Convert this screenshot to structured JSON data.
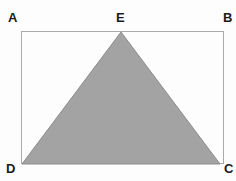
{
  "figure": {
    "kind": "geometry-diagram",
    "background_color": "#fdfdfd",
    "rectangle": {
      "name": "rectangle-ABCD",
      "vertices_order": [
        "A",
        "B",
        "C",
        "D"
      ],
      "x": 21,
      "y": 31,
      "width": 203,
      "height": 133,
      "stroke_color": "#aaaaaa",
      "stroke_width": 1,
      "fill": "none"
    },
    "triangle": {
      "name": "triangle-DEC",
      "vertices_order": [
        "D",
        "E",
        "C"
      ],
      "points": [
        {
          "label": "D",
          "x": 22,
          "y": 164
        },
        {
          "label": "E",
          "x": 121,
          "y": 32
        },
        {
          "label": "C",
          "x": 220,
          "y": 164
        }
      ],
      "fill_color": "#a3a3a3",
      "stroke_color": "#8c8c8c",
      "stroke_width": 1
    },
    "labels": [
      {
        "id": "A",
        "text": "A",
        "x": 8,
        "y": 11,
        "corner": "top-left",
        "color": "#1a1a1a"
      },
      {
        "id": "B",
        "text": "B",
        "x": 223,
        "y": 11,
        "corner": "top-right",
        "color": "#1a1a1a"
      },
      {
        "id": "E",
        "text": "E",
        "x": 116,
        "y": 11,
        "corner": "top-center",
        "color": "#1a1a1a"
      },
      {
        "id": "D",
        "text": "D",
        "x": 6,
        "y": 162,
        "corner": "bottom-left",
        "color": "#1a1a1a"
      },
      {
        "id": "C",
        "text": "C",
        "x": 224,
        "y": 162,
        "corner": "bottom-right",
        "color": "#1a1a1a"
      }
    ]
  }
}
